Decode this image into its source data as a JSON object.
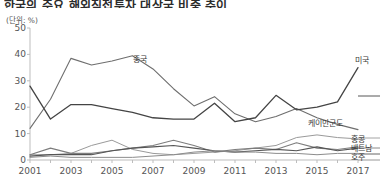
{
  "title": "한국의 주요 해외직접투자 대상국 비중 추이",
  "unit_note": "(단위: %)",
  "axes": {
    "y_ticks": [
      0,
      10,
      20,
      30,
      40,
      50
    ],
    "y_min": 0,
    "y_max": 50,
    "x_ticks": [
      "2001",
      "2003",
      "2005",
      "2007",
      "2009",
      "2011",
      "2013",
      "2015",
      "2017"
    ],
    "x_min": 2001,
    "x_max": 2017
  },
  "series_labels": {
    "china": "중국",
    "usa": "미국",
    "cayman": "케이만군도",
    "hongkong": "홍콩",
    "vietnam": "베트남",
    "australia": "호주"
  },
  "colors": {
    "china": "#6e6e6e",
    "usa": "#444444",
    "cayman": "#9a9a9a",
    "hongkong": "#7d7d7d",
    "vietnam": "#555555",
    "australia": "#8c8c8c",
    "axis": "#bdbdbd",
    "text": "#555555"
  },
  "chart_data": {
    "type": "line",
    "title": "한국의 주요 해외직접투자 대상국 비중 추이",
    "xlabel": "",
    "ylabel": "",
    "unit": "%",
    "ylim": [
      0,
      50
    ],
    "xlim": [
      2001,
      2017
    ],
    "grid": false,
    "legend_position": "inline-right",
    "x": [
      2001,
      2002,
      2003,
      2004,
      2005,
      2006,
      2007,
      2008,
      2009,
      2010,
      2011,
      2012,
      2013,
      2014,
      2015,
      2016,
      2017
    ],
    "series": [
      {
        "name": "중국",
        "values": [
          12.0,
          23.0,
          38.5,
          36.0,
          37.5,
          39.5,
          34.5,
          27.0,
          20.5,
          24.0,
          17.5,
          14.5,
          16.5,
          19.5,
          16.0,
          13.5,
          11.5
        ]
      },
      {
        "name": "미국",
        "values": [
          28.0,
          15.5,
          21.0,
          21.0,
          19.5,
          18.0,
          16.0,
          15.5,
          15.5,
          21.5,
          14.5,
          16.0,
          24.5,
          19.0,
          20.0,
          22.0,
          35.0
        ]
      },
      {
        "name": "케이만군도",
        "values": [
          2.0,
          2.0,
          2.5,
          5.5,
          7.5,
          4.0,
          2.5,
          2.0,
          2.5,
          3.0,
          3.5,
          4.5,
          5.5,
          8.5,
          9.5,
          8.5,
          8.0
        ]
      },
      {
        "name": "홍콩",
        "values": [
          2.0,
          4.5,
          2.5,
          2.5,
          3.5,
          4.5,
          5.5,
          7.5,
          5.5,
          3.0,
          4.0,
          4.5,
          4.0,
          6.5,
          4.5,
          4.0,
          5.0
        ]
      },
      {
        "name": "베트남",
        "values": [
          1.5,
          2.0,
          2.0,
          2.0,
          3.5,
          4.5,
          5.0,
          5.5,
          4.5,
          3.5,
          3.0,
          3.5,
          4.0,
          3.5,
          5.0,
          3.5,
          4.5
        ]
      },
      {
        "name": "호주",
        "values": [
          1.0,
          1.5,
          1.0,
          1.0,
          1.0,
          1.0,
          1.5,
          2.0,
          3.0,
          3.5,
          3.0,
          3.0,
          2.5,
          2.5,
          2.0,
          2.5,
          2.5
        ]
      }
    ]
  }
}
